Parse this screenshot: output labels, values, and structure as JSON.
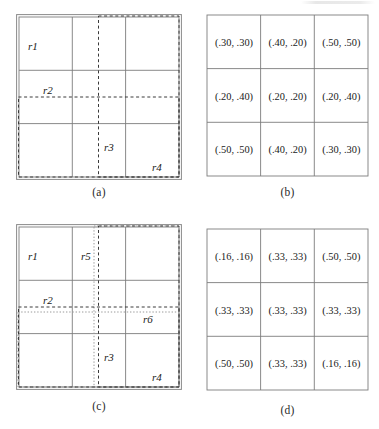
{
  "figure": {
    "panels": [
      {
        "id": "a",
        "caption": "(a)",
        "type": "grid-regions",
        "grid": {
          "rows": 3,
          "cols": 3
        },
        "region_labels": [
          "r1",
          "r2",
          "r3",
          "r4"
        ]
      },
      {
        "id": "b",
        "caption": "(b)",
        "type": "value-table",
        "grid": {
          "rows": 3,
          "cols": 3
        },
        "cells": [
          [
            "(.30, .30)",
            "(.40, .20)",
            "(.50, .50)"
          ],
          [
            "(.20, .40)",
            "(.20, .20)",
            "(.20, .40)"
          ],
          [
            "(.50, .50)",
            "(.40, .20)",
            "(.30, .30)"
          ]
        ]
      },
      {
        "id": "c",
        "caption": "(c)",
        "type": "grid-regions",
        "grid": {
          "rows": 3,
          "cols": 3
        },
        "region_labels": [
          "r1",
          "r2",
          "r3",
          "r4",
          "r5",
          "r6"
        ]
      },
      {
        "id": "d",
        "caption": "(d)",
        "type": "value-table",
        "grid": {
          "rows": 3,
          "cols": 3
        },
        "cells": [
          [
            "(.16, .16)",
            "(.33, .33)",
            "(.50, .50)"
          ],
          [
            "(.33, .33)",
            "(.33, .33)",
            "(.33, .33)"
          ],
          [
            "(.50, .50)",
            "(.33, .33)",
            "(.16, .16)"
          ]
        ]
      }
    ],
    "colors": {
      "grid_line": "#7d7d7d",
      "frame": "#8a8a8a",
      "overlay": "#3a3a3a",
      "text": "#1a1a1a",
      "background": "#ffffff"
    }
  }
}
